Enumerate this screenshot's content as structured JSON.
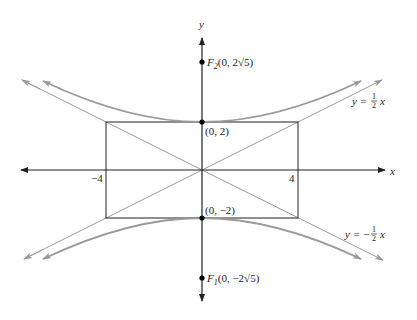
{
  "figure": {
    "type": "hyperbola-graph",
    "equation_implied": "y^2/4 - x^2/16 = 1",
    "axes": {
      "x_label": "x",
      "y_label": "y",
      "x_ticks": [
        {
          "value": -4,
          "label": "−4"
        },
        {
          "value": 4,
          "label": "4"
        }
      ]
    },
    "points": {
      "vertex_top": {
        "label": "(0, 2)"
      },
      "vertex_bottom": {
        "label": "(0, −2)"
      },
      "focus_top": {
        "name": "F",
        "sub": "2",
        "coords": "(0, 2√5)"
      },
      "focus_bottom": {
        "name": "F",
        "sub": "1",
        "coords": "(0, −2√5)"
      }
    },
    "asymptotes": {
      "positive": {
        "lhs": "y = ",
        "num": "1",
        "den": "2",
        "var": "x"
      },
      "negative": {
        "lhs": "y = −",
        "num": "1",
        "den": "2",
        "var": "x"
      }
    },
    "colors": {
      "axes": "#222222",
      "rectangle": "#333333",
      "asymptote": "#9a9a9a",
      "hyperbola": "#9a9a9a",
      "points": "#000000"
    }
  }
}
